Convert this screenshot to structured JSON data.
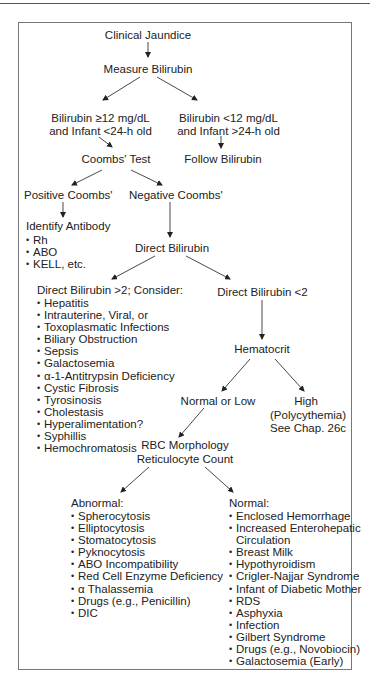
{
  "flowchart": {
    "title": "Clinical Jaundice",
    "measure": "Measure Bilirubin",
    "high_branch": [
      "Bilirubin ≥12 mg/dL",
      "and Infant <24-h old"
    ],
    "low_branch": [
      "Bilirubin <12 mg/dL",
      "and Infant >24-h old"
    ],
    "coombs_test": "Coombs' Test",
    "follow_bilirubin": "Follow Bilirubin",
    "positive_coombs": "Positive Coombs'",
    "negative_coombs": "Negative Coombs'",
    "identify_antibody": {
      "heading": "Identify Antibody",
      "items": [
        "Rh",
        "ABO",
        "KELL, etc."
      ]
    },
    "direct_bilirubin": "Direct Bilirubin",
    "direct_high": {
      "heading": "Direct Bilirubin >2; Consider:",
      "items": [
        "Hepatitis",
        "Intrauterine, Viral, or",
        "Toxoplasmatic Infections",
        "Biliary Obstruction",
        "Sepsis",
        "Galactosemia",
        "α-1-Antitrypsin Deficiency",
        "Cystic Fibrosis",
        "Tyrosinosis",
        "Cholestasis",
        "Hyperalimentation?",
        "Syphillis",
        "Hemochromatosis"
      ]
    },
    "direct_low": "Direct Bilirubin <2",
    "hematocrit": "Hematocrit",
    "normal_or_low": "Normal or Low",
    "high": [
      "High",
      "(Polycythemia)",
      "See Chap. 26c"
    ],
    "rbc": [
      "RBC Morphology",
      "Reticulocyte Count"
    ],
    "abnormal": {
      "heading": "Abnormal:",
      "items": [
        "Spherocytosis",
        "Elliptocytosis",
        "Stomatocytosis",
        "Pyknocytosis",
        "ABO Incompatibility",
        "Red Cell Enzyme Deficiency",
        "α Thalassemia",
        "Drugs (e.g., Penicillin)",
        "DIC"
      ]
    },
    "normal": {
      "heading": "Normal:",
      "items": [
        "Enclosed Hemorrhage",
        "Increased Enterohepatic",
        "Circulation",
        "Breast Milk",
        "Hypothyroidism",
        "Crigler-Najjar Syndrome",
        "Infant of Diabetic Mother",
        "RDS",
        "Asphyxia",
        "Infection",
        "Gilbert Syndrome",
        "Drugs (e.g., Novobiocin)",
        "Galactosemia (Early)"
      ]
    }
  },
  "colors": {
    "text": "#222222",
    "lines": "#333333",
    "frame": "#777777",
    "background": "#ffffff"
  }
}
